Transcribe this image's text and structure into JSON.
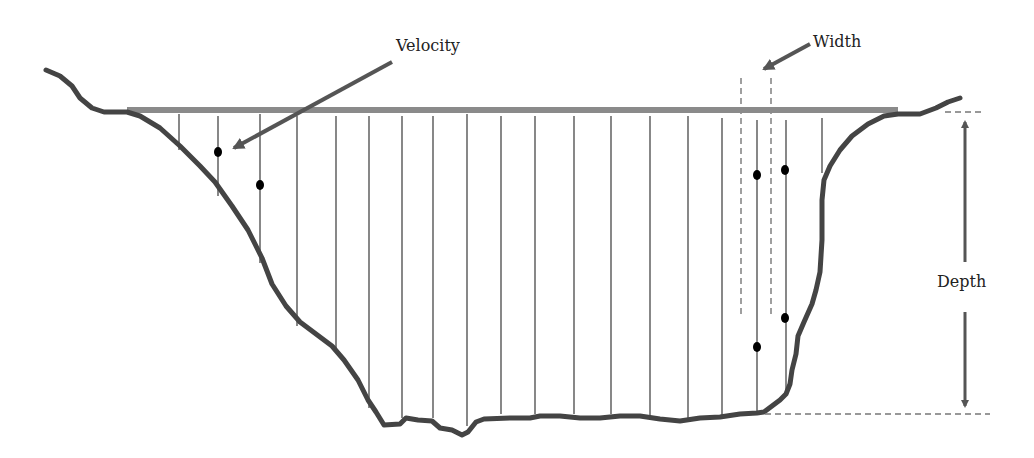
{
  "diagram": {
    "type": "river-channel-cross-section",
    "labels": {
      "velocity": "Velocity",
      "width": "Width",
      "depth": "Depth"
    },
    "colors": {
      "channel_bed": "#444444",
      "water_surface": "#8a8a8a",
      "verticals": "#555555",
      "arrows": "#555555",
      "dashed_guides": "#777777",
      "velocity_points": "#000000",
      "text": "#222222"
    },
    "verticals_x": [
      179,
      218,
      260,
      297,
      336,
      369,
      402,
      433,
      467,
      501,
      535,
      574,
      611,
      650,
      688,
      722,
      757,
      786,
      822
    ],
    "velocity_points": [
      {
        "x": 218,
        "y": 152
      },
      {
        "x": 260,
        "y": 185
      },
      {
        "x": 757,
        "y": 175
      },
      {
        "x": 785,
        "y": 170
      },
      {
        "x": 785,
        "y": 318
      },
      {
        "x": 757,
        "y": 347
      }
    ],
    "water_surface": {
      "x1": 127,
      "x2": 898,
      "y": 110
    },
    "depth_dimension": {
      "x": 965,
      "y_top": 112,
      "y_bottom": 414
    },
    "width_guides": {
      "x_left": 741,
      "x_right": 771,
      "y_top": 78,
      "y_bottom": 316
    }
  }
}
